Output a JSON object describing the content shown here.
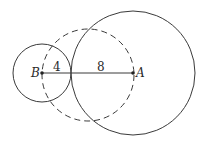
{
  "diagram": {
    "points": {
      "B": {
        "label": "B",
        "x": 42,
        "y": 73
      },
      "A": {
        "label": "A",
        "x": 133,
        "y": 73
      }
    },
    "circles": [
      {
        "name": "circle-B",
        "cx": 42,
        "cy": 73,
        "r": 29,
        "style": "solid"
      },
      {
        "name": "circle-A",
        "cx": 133,
        "cy": 73,
        "r": 62,
        "style": "solid"
      },
      {
        "name": "circle-dashed",
        "cx": 88,
        "cy": 75,
        "r": 46,
        "style": "dashed"
      }
    ],
    "segment_labels": {
      "left": "4",
      "right": "8"
    },
    "colors": {
      "stroke": "#3a3a3a",
      "background": "#ffffff"
    }
  }
}
